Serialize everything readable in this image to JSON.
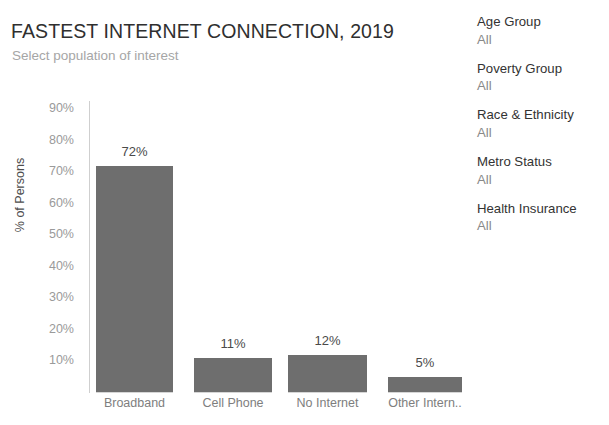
{
  "header": {
    "title": "FASTEST INTERNET CONNECTION, 2019",
    "subtitle": "Select population of interest"
  },
  "filters": [
    {
      "name": "Age Group",
      "value": "All"
    },
    {
      "name": "Poverty Group",
      "value": "All"
    },
    {
      "name": "Race  & Ethnicity",
      "value": "All"
    },
    {
      "name": "Metro Status",
      "value": "All"
    },
    {
      "name": "Health Insurance",
      "value": "All"
    }
  ],
  "colors": {
    "bar": "#6e6e6e",
    "title": "#2f2f2f",
    "subtitle": "#a6a6a6",
    "tick": "#9a9a9a",
    "axis": "#cfcfcf"
  },
  "chart_data": {
    "type": "bar",
    "title": "FASTEST INTERNET CONNECTION, 2019",
    "subtitle": "Select population of interest",
    "categories": [
      "Broadband",
      "Cell Phone",
      "No Internet",
      "Other Intern.."
    ],
    "values": [
      72,
      11,
      12,
      5
    ],
    "data_labels": [
      "72%",
      "11%",
      "12%",
      "5%"
    ],
    "xlabel": "",
    "ylabel": "% of Persons",
    "ylim": [
      0,
      95
    ],
    "ytick_values": [
      10,
      20,
      30,
      40,
      50,
      60,
      70,
      80,
      90
    ],
    "ytick_labels": [
      "10%",
      "20%",
      "30%",
      "40%",
      "50%",
      "60%",
      "70%",
      "80%",
      "90%"
    ],
    "grid": false,
    "legend": "none",
    "units": "percent"
  }
}
